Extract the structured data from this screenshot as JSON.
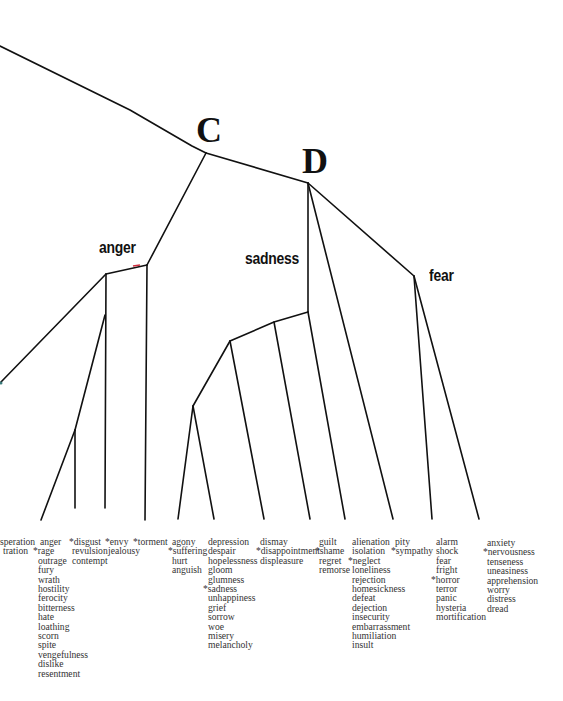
{
  "diagram": {
    "type": "hierarchical-cluster-tree",
    "nodes": {
      "C": "C",
      "D": "D",
      "anger": "anger",
      "sadness": "sadness",
      "fear": "fear"
    },
    "leaf_clusters": [
      {
        "id": "exasperation",
        "words": [
          "speration",
          "tration"
        ]
      },
      {
        "id": "rage",
        "words": [
          "anger",
          "*rage",
          "outrage",
          "fury",
          "wrath",
          "hostility",
          "ferocity",
          "bitterness",
          "hate",
          "loathing",
          "scorn",
          "spite",
          "vengefulness",
          "dislike",
          "resentment"
        ]
      },
      {
        "id": "disgust",
        "words": [
          "*disgust",
          "revulsion",
          "contempt"
        ]
      },
      {
        "id": "envy",
        "words": [
          "*envy",
          "jealousy"
        ]
      },
      {
        "id": "torment",
        "words": [
          "*torment"
        ]
      },
      {
        "id": "suffering",
        "words": [
          "agony",
          "*suffering",
          "hurt",
          "anguish"
        ]
      },
      {
        "id": "sadness",
        "words": [
          "depression",
          "despair",
          "hopelessness",
          "gloom",
          "glumness",
          "*sadness",
          "unhappiness",
          "grief",
          "sorrow",
          "woe",
          "misery",
          "melancholy"
        ]
      },
      {
        "id": "disappointment",
        "words": [
          "dismay",
          "*disappointment",
          "displeasure"
        ]
      },
      {
        "id": "shame",
        "words": [
          "guilt",
          "*shame",
          "regret",
          "remorse"
        ]
      },
      {
        "id": "neglect",
        "words": [
          "alienation",
          "isolation",
          "*neglect",
          "loneliness",
          "rejection",
          "homesickness",
          "defeat",
          "dejection",
          "insecurity",
          "embarrassment",
          "humiliation",
          "insult"
        ]
      },
      {
        "id": "sympathy",
        "words": [
          "pity",
          "*sympathy"
        ]
      },
      {
        "id": "horror",
        "words": [
          "alarm",
          "shock",
          "fear",
          "fright",
          "*horror",
          "terror",
          "panic",
          "hysteria",
          "mortification"
        ]
      },
      {
        "id": "nervousness",
        "words": [
          "anxiety",
          "*nervousness",
          "tenseness",
          "uneasiness",
          "apprehension",
          "worry",
          "distress",
          "dread"
        ]
      }
    ],
    "colors": {
      "line": "#111111",
      "text": "#2a2a2a",
      "background": "#ffffff"
    }
  }
}
